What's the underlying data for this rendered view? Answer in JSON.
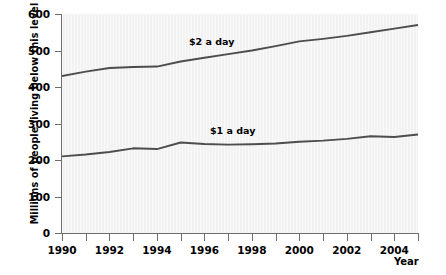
{
  "chart_data": {
    "type": "line",
    "title": "",
    "xlabel": "Year",
    "ylabel": "Millions of people living below this level",
    "xlim": [
      1990,
      2005
    ],
    "ylim": [
      0,
      600
    ],
    "grid": false,
    "legend_position": "inline-annotation",
    "x": [
      1990,
      1991,
      1992,
      1993,
      1994,
      1995,
      1996,
      1997,
      1998,
      1999,
      2000,
      2001,
      2002,
      2003,
      2004,
      2005
    ],
    "xticks": [
      1990,
      1992,
      1994,
      1996,
      1998,
      2000,
      2002,
      2004
    ],
    "xtick_labels": [
      "1990",
      "1992",
      "1994",
      "1996",
      "1998",
      "2000",
      "2002",
      "2004"
    ],
    "yticks": [
      0,
      100,
      200,
      300,
      400,
      500,
      600
    ],
    "ytick_labels": [
      "0",
      "100",
      "200",
      "300",
      "400",
      "500",
      "600"
    ],
    "series": [
      {
        "name": "$2 a day",
        "color": "#4d4d4d",
        "values": [
          430,
          442,
          452,
          455,
          456,
          470,
          480,
          490,
          500,
          512,
          525,
          532,
          540,
          550,
          560,
          570
        ]
      },
      {
        "name": "$1 a day",
        "color": "#4d4d4d",
        "values": [
          210,
          215,
          222,
          232,
          230,
          248,
          244,
          242,
          243,
          245,
          250,
          253,
          258,
          265,
          263,
          270
        ]
      }
    ],
    "annotations": [
      {
        "text": "$2 a day",
        "x": 1998,
        "y": 540
      },
      {
        "text": "$1 a day",
        "x": 1999,
        "y": 320
      }
    ]
  },
  "axes": {
    "x_title": "Year",
    "y_title": "Millions of people living below this level"
  }
}
